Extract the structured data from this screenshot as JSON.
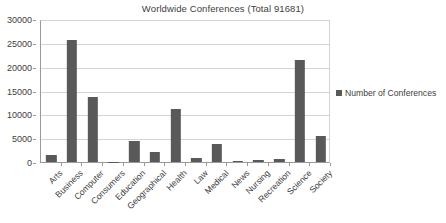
{
  "chart_data": {
    "type": "bar",
    "title": "Worldwide Conferences (Total 91681)",
    "xlabel": "",
    "ylabel": "",
    "ylim": [
      0,
      30000
    ],
    "ytick_step": 5000,
    "yticks": [
      "0",
      "5000",
      "10000",
      "15000",
      "20000",
      "25000",
      "30000"
    ],
    "grid": true,
    "legend_position": "right",
    "bar_color": "#595959",
    "categories": [
      "Arts",
      "Business",
      "Computer",
      "Consumers",
      "Education",
      "Geographical",
      "Health",
      "Law",
      "Medical",
      "News",
      "Nursing",
      "Recreation",
      "Science",
      "Society"
    ],
    "series": [
      {
        "name": "Number of Conferences",
        "values": [
          1500,
          25700,
          13600,
          30,
          4400,
          2200,
          11100,
          800,
          3700,
          300,
          500,
          550,
          21400,
          5500
        ]
      }
    ]
  },
  "legend": {
    "entries": [
      {
        "label": "Number of Conferences",
        "color": "#595959"
      }
    ]
  }
}
